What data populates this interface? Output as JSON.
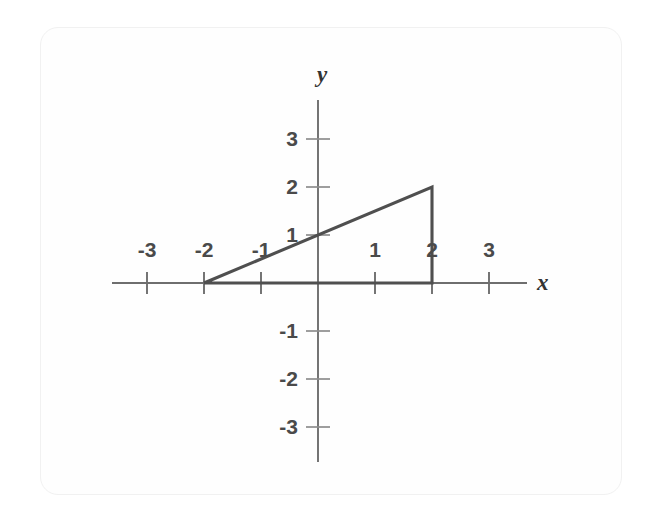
{
  "figure": {
    "kind": "cartesian-plane-graph",
    "background_color": "#ffffff",
    "card_border_color": "#f1f1f1",
    "axis_color": "#6e6e6e",
    "shape_color": "#4f4f4f",
    "label_color": "#4a4a4a"
  },
  "axis_labels": {
    "x": "x",
    "y": "y"
  },
  "chart_data": {
    "type": "line",
    "title": "",
    "subtitle": "",
    "xlabel": "x",
    "ylabel": "y",
    "xlim": [
      -3.6,
      3.6
    ],
    "ylim": [
      -3.6,
      3.6
    ],
    "grid": false,
    "legend": "none",
    "x_ticks": [
      -3,
      -2,
      -1,
      1,
      2,
      3
    ],
    "y_ticks": [
      3,
      2,
      1,
      -1,
      -2,
      -3
    ],
    "x_tick_labels": [
      "-3",
      "-2",
      "-1",
      "1",
      "2",
      "3"
    ],
    "y_tick_labels": [
      "3",
      "2",
      "1",
      "-1",
      "-2",
      "-3"
    ],
    "annotations": [],
    "series": [
      {
        "name": "triangle",
        "shape": "closed-polygon",
        "closed": true,
        "vertices": [
          {
            "x": -2,
            "y": 0
          },
          {
            "x": 2,
            "y": 2
          },
          {
            "x": 2,
            "y": 0
          }
        ],
        "edges": [
          {
            "name": "hypotenuse",
            "from": {
              "x": -2,
              "y": 0
            },
            "to": {
              "x": 2,
              "y": 2
            }
          },
          {
            "name": "vertical-leg",
            "from": {
              "x": 2,
              "y": 2
            },
            "to": {
              "x": 2,
              "y": 0
            }
          },
          {
            "name": "horizontal-leg",
            "from": {
              "x": 2,
              "y": 0
            },
            "to": {
              "x": -2,
              "y": 0
            }
          }
        ],
        "hypotenuse_equation": "y = (x + 2) / 2",
        "hypotenuse_y_intercept": {
          "x": 0,
          "y": 1
        },
        "base_length": 4,
        "height": 2
      }
    ]
  },
  "geometry": {
    "origin_px": {
      "x": 318,
      "y": 283
    },
    "unit_px": {
      "x": 57,
      "y": 48
    },
    "x_axis_span_px": {
      "from": 112,
      "to": 527
    },
    "y_axis_span_px": {
      "from": 100,
      "to": 462
    },
    "tick_half_len_px": {
      "x": 11,
      "y": 12
    }
  }
}
